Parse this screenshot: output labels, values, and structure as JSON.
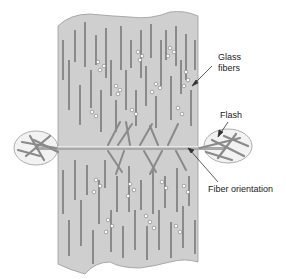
{
  "diagram": {
    "labels": {
      "glass_fibers_line1": "Glass",
      "glass_fibers_line2": "fibers",
      "flash": "Flash",
      "fiber_orientation": "Fiber orientation"
    },
    "colors": {
      "matrix": "#cfcfcf",
      "fiber": "#8a8a8a",
      "fiber_end": "#ffffff",
      "flash_envelope": "#f2f2f2",
      "outline": "#888888",
      "arrow": "#333333"
    }
  }
}
